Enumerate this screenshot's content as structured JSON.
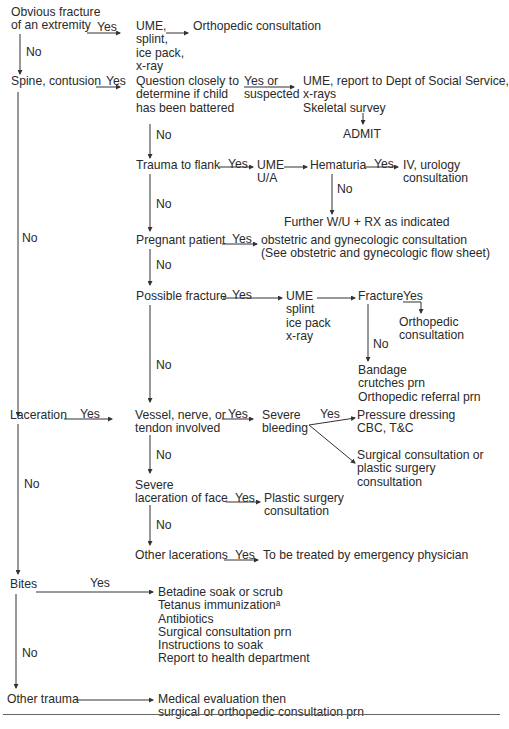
{
  "nodes": {
    "obvious_fracture": "Obvious fracture\nof an extremity",
    "ume_splint_1": "UME,\nsplint,\nice pack,\nx-ray",
    "ortho_consult_1": "Orthopedic consultation",
    "spine_contusion": "Spine, contusion",
    "question_battered": "Question closely to\ndetermine if child\nhas been battered",
    "ume_report": "UME, report to Dept of Social Service,\nx-rays\nSkeletal survey",
    "admit": "ADMIT",
    "trauma_flank": "Trauma to flank",
    "ume_ua": "UME\nU/A",
    "hematuria": "Hematuria",
    "iv_urology": "IV, urology\nconsultation",
    "further_wu": "Further W/U + RX as indicated",
    "pregnant": "Pregnant patient",
    "obstetric": "obstetric and gynecologic consultation\n(See obstetric and gynecologic flow sheet)",
    "possible_fracture": "Possible fracture",
    "ume_splint_2": "UME\nsplint\nice pack\nx-ray",
    "fracture": "Fracture",
    "ortho_consult_2": "Orthopedic\nconsultation",
    "bandage": "Bandage\ncrutches prn\nOrthopedic referral prn",
    "laceration": "Laceration",
    "vessel_nerve": "Vessel, nerve, or\ntendon involved",
    "severe_bleeding": "Severe\nbleeding",
    "pressure_dressing": "Pressure dressing\nCBC, T&C",
    "surgical_or_plastic": "Surgical consultation or\nplastic surgery\nconsultation",
    "severe_face": "Severe\nlaceration of face",
    "plastic_surgery": "Plastic surgery\nconsultation",
    "other_lacerations": "Other lacerations",
    "emergency_physician": "To be treated by emergency physician",
    "bites": "Bites",
    "bites_treatment": "Betadine soak or scrub\nTetanus immunizationᵃ\nAntibiotics\nSurgical consultation prn\nInstructions to soak\nReport to health department",
    "other_trauma": "Other trauma",
    "medical_eval": "Medical evaluation then\nsurgical or orthopedic consultation prn"
  },
  "edge_labels": {
    "yes": "Yes",
    "no": "No",
    "yes_or_suspected": "Yes or\nsuspected"
  }
}
